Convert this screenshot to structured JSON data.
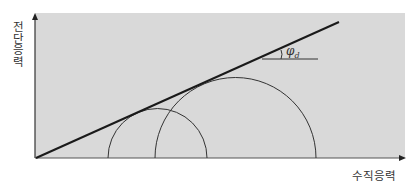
{
  "diagram": {
    "type": "mohr-coulomb-failure-envelope",
    "y_axis_label": "전단응력",
    "x_axis_label": "수직응력",
    "angle_label": {
      "symbol": "φ",
      "subscript": "d"
    },
    "colors": {
      "background_panel": "#d9d9d9",
      "line": "#222222",
      "circle": "#333333",
      "text": "#333333"
    },
    "circles": [
      {
        "name": "small-mohr-circle",
        "center_x": 157.5,
        "radius": 49.5
      },
      {
        "name": "large-mohr-circle",
        "center_x": 235.5,
        "radius": 80.5
      }
    ],
    "envelope": {
      "x1": 36,
      "y1": 158,
      "x2": 339,
      "y2": 22
    }
  }
}
